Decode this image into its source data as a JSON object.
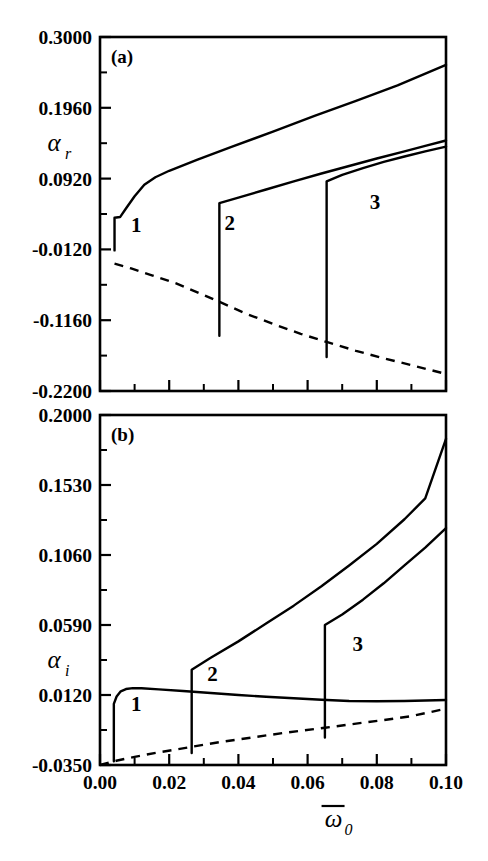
{
  "figure": {
    "background": "#ffffff",
    "line_color": "#000000",
    "width": 488,
    "height": 861
  },
  "chart_data": [
    {
      "type": "line",
      "panel_tag": "(a)",
      "title": "",
      "xlabel": "ω̃0",
      "ylabel": "αr",
      "ylabel_symbol": "α",
      "ylabel_subscript": "r",
      "xlabel_symbol": "ω",
      "xlabel_subscript": "0",
      "xlabel_overbar": true,
      "xlim": [
        0.0,
        0.1
      ],
      "ylim": [
        -0.22,
        0.3
      ],
      "xticks": [
        0.0,
        0.02,
        0.04,
        0.06,
        0.08,
        0.1
      ],
      "xticklabels": [
        "0.00",
        "0.02",
        "0.04",
        "0.06",
        "0.08",
        "0.10"
      ],
      "yticks": [
        0.3,
        0.196,
        0.092,
        -0.012,
        -0.116,
        -0.22
      ],
      "yticklabels": [
        "0.3000",
        "0.1960",
        "0.0920",
        "-0.0120",
        "-0.1160",
        "-0.2200"
      ],
      "minor_ticks_per_interval": 1,
      "grid": false,
      "legend": "none",
      "annotations": [
        {
          "text": "1",
          "x": 0.0105,
          "y": 0.013
        },
        {
          "text": "2",
          "x": 0.0375,
          "y": 0.016
        },
        {
          "text": "3",
          "x": 0.0795,
          "y": 0.047
        }
      ],
      "series": [
        {
          "name": "branch-1",
          "style": "solid",
          "points": [
            [
              0.0042,
              -0.0135
            ],
            [
              0.0042,
              0.0345
            ],
            [
              0.0058,
              0.0355
            ],
            [
              0.0075,
              0.048
            ],
            [
              0.01,
              0.066
            ],
            [
              0.0128,
              0.083
            ],
            [
              0.016,
              0.094
            ],
            [
              0.02,
              0.1035
            ],
            [
              0.028,
              0.1195
            ],
            [
              0.038,
              0.1385
            ],
            [
              0.05,
              0.161
            ],
            [
              0.062,
              0.184
            ],
            [
              0.074,
              0.206
            ],
            [
              0.086,
              0.229
            ],
            [
              0.1,
              0.259
            ]
          ]
        },
        {
          "name": "branch-2",
          "style": "solid",
          "points": [
            [
              0.0345,
              -0.139
            ],
            [
              0.0345,
              0.056
            ],
            [
              0.04,
              0.064
            ],
            [
              0.048,
              0.076
            ],
            [
              0.056,
              0.088
            ],
            [
              0.064,
              0.0995
            ],
            [
              0.072,
              0.1105
            ],
            [
              0.08,
              0.1215
            ],
            [
              0.088,
              0.132
            ],
            [
              0.094,
              0.14
            ],
            [
              0.1,
              0.148
            ]
          ]
        },
        {
          "name": "branch-3",
          "style": "solid",
          "points": [
            [
              0.0655,
              -0.17
            ],
            [
              0.0655,
              0.088
            ],
            [
              0.07,
              0.0975
            ],
            [
              0.076,
              0.1075
            ],
            [
              0.082,
              0.1165
            ],
            [
              0.088,
              0.1245
            ],
            [
              0.094,
              0.132
            ],
            [
              0.1,
              0.139
            ]
          ]
        },
        {
          "name": "unstable-dashed",
          "style": "dashed",
          "points": [
            [
              0.0042,
              -0.033
            ],
            [
              0.009,
              -0.04
            ],
            [
              0.015,
              -0.05
            ],
            [
              0.022,
              -0.062
            ],
            [
              0.03,
              -0.079
            ],
            [
              0.0345,
              -0.089
            ],
            [
              0.042,
              -0.106
            ],
            [
              0.05,
              -0.1215
            ],
            [
              0.058,
              -0.136
            ],
            [
              0.0655,
              -0.148
            ],
            [
              0.074,
              -0.161
            ],
            [
              0.082,
              -0.172
            ],
            [
              0.09,
              -0.182
            ],
            [
              0.1,
              -0.195
            ]
          ]
        }
      ]
    },
    {
      "type": "line",
      "panel_tag": "(b)",
      "title": "",
      "xlabel": "ω̃0",
      "ylabel": "αi",
      "ylabel_symbol": "α",
      "ylabel_subscript": "i",
      "xlabel_symbol": "ω",
      "xlabel_subscript": "0",
      "xlabel_overbar": true,
      "xlim": [
        0.0,
        0.1
      ],
      "ylim": [
        -0.035,
        0.2
      ],
      "xticks": [
        0.0,
        0.02,
        0.04,
        0.06,
        0.08,
        0.1
      ],
      "xticklabels": [
        "0.00",
        "0.02",
        "0.04",
        "0.06",
        "0.08",
        "0.10"
      ],
      "yticks": [
        0.2,
        0.153,
        0.106,
        0.059,
        0.012,
        -0.035
      ],
      "yticklabels": [
        "0.2000",
        "0.1530",
        "0.1060",
        "0.0590",
        "0.0120",
        "-0.0350"
      ],
      "minor_ticks_per_interval": 1,
      "grid": false,
      "legend": "none",
      "annotations": [
        {
          "text": "1",
          "x": 0.0105,
          "y": 0.001
        },
        {
          "text": "2",
          "x": 0.0325,
          "y": 0.0215
        },
        {
          "text": "3",
          "x": 0.0745,
          "y": 0.0415
        }
      ],
      "series": [
        {
          "name": "branch-1",
          "style": "solid",
          "points": [
            [
              0.004,
              -0.0325
            ],
            [
              0.004,
              0.006
            ],
            [
              0.0048,
              0.011
            ],
            [
              0.006,
              0.0145
            ],
            [
              0.0075,
              0.016
            ],
            [
              0.0095,
              0.0166
            ],
            [
              0.012,
              0.0165
            ],
            [
              0.017,
              0.0158
            ],
            [
              0.024,
              0.0147
            ],
            [
              0.032,
              0.0133
            ],
            [
              0.04,
              0.012
            ],
            [
              0.048,
              0.0108
            ],
            [
              0.056,
              0.0098
            ],
            [
              0.064,
              0.0088
            ],
            [
              0.072,
              0.008
            ],
            [
              0.08,
              0.0078
            ],
            [
              0.088,
              0.008
            ],
            [
              0.1,
              0.0086
            ]
          ]
        },
        {
          "name": "branch-2",
          "style": "solid",
          "points": [
            [
              0.0265,
              -0.027
            ],
            [
              0.0265,
              0.029
            ],
            [
              0.032,
              0.037
            ],
            [
              0.04,
              0.048
            ],
            [
              0.048,
              0.06
            ],
            [
              0.056,
              0.072
            ],
            [
              0.064,
              0.085
            ],
            [
              0.072,
              0.099
            ],
            [
              0.08,
              0.1135
            ],
            [
              0.088,
              0.13
            ],
            [
              0.094,
              0.144
            ],
            [
              0.1,
              0.184
            ]
          ]
        },
        {
          "name": "branch-3",
          "style": "solid",
          "points": [
            [
              0.065,
              -0.0165
            ],
            [
              0.065,
              0.059
            ],
            [
              0.07,
              0.066
            ],
            [
              0.076,
              0.076
            ],
            [
              0.082,
              0.087
            ],
            [
              0.088,
              0.099
            ],
            [
              0.094,
              0.111
            ],
            [
              0.1,
              0.124
            ]
          ]
        },
        {
          "name": "unstable-dashed",
          "style": "dashed",
          "points": [
            [
              0.0,
              -0.035
            ],
            [
              0.005,
              -0.032
            ],
            [
              0.01,
              -0.0295
            ],
            [
              0.017,
              -0.0265
            ],
            [
              0.0265,
              -0.0228
            ],
            [
              0.035,
              -0.0195
            ],
            [
              0.044,
              -0.0165
            ],
            [
              0.053,
              -0.0135
            ],
            [
              0.065,
              -0.01
            ],
            [
              0.074,
              -0.0072
            ],
            [
              0.082,
              -0.0048
            ],
            [
              0.09,
              -0.0022
            ],
            [
              0.1,
              0.0028
            ]
          ]
        }
      ]
    }
  ]
}
